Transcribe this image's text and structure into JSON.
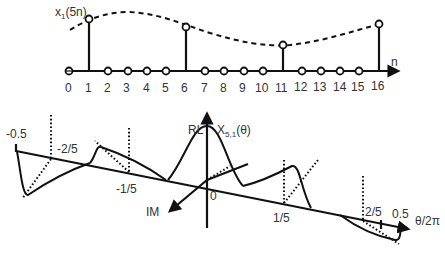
{
  "top_plot": {
    "signal_label_base": "x",
    "signal_label_sub": "1",
    "signal_label_arg": "(5n)",
    "axis_label": "n",
    "ticks": [
      "0",
      "1",
      "2",
      "3",
      "4",
      "5",
      "6",
      "7",
      "8",
      "9",
      "10",
      "11",
      "12",
      "13",
      "14",
      "15",
      "16"
    ],
    "nonzero_samples": [
      1,
      6,
      11,
      16
    ],
    "envelope_style": "dashed"
  },
  "bottom_plot": {
    "vertical_axis_label": "RL",
    "depth_axis_label": "IM",
    "spectrum_label_base": "X",
    "spectrum_label_sub": "5,1",
    "spectrum_label_arg": "(θ)",
    "origin_label": "0",
    "horizontal_axis_label": "θ/2π",
    "freq_ticks": [
      "-0.5",
      "-2/5",
      "-1/5",
      "1/5",
      "2/5",
      "0.5"
    ]
  },
  "colors": {
    "ink": "#111111",
    "text": "#333333",
    "background": "#ffffff"
  }
}
